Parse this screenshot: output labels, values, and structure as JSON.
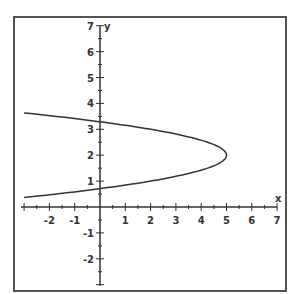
{
  "chart_data": {
    "type": "line",
    "title": "",
    "xlabel": "x",
    "ylabel": "y",
    "xlim": [
      -3,
      7
    ],
    "ylim": [
      -3,
      7
    ],
    "grid": false,
    "x_ticks": [
      -2,
      -1,
      1,
      2,
      3,
      4,
      5,
      6,
      7
    ],
    "y_ticks": [
      -2,
      -1,
      1,
      2,
      3,
      4,
      5,
      6,
      7
    ],
    "minor_tick_step": 0.5,
    "series": [
      {
        "name": "x = 5 - 3(y - 2)^2",
        "equation": "x = 5 - 3(y-2)^2",
        "vertex": [
          5,
          2
        ],
        "points": [
          [
            -3,
            3.63
          ],
          [
            -2,
            3.53
          ],
          [
            -1,
            3.41
          ],
          [
            0,
            3.29
          ],
          [
            1,
            3.15
          ],
          [
            2,
            3.0
          ],
          [
            3,
            2.82
          ],
          [
            4,
            2.58
          ],
          [
            4.5,
            2.41
          ],
          [
            5,
            2.0
          ],
          [
            4.5,
            1.59
          ],
          [
            4,
            1.42
          ],
          [
            3,
            1.18
          ],
          [
            2,
            1.0
          ],
          [
            1,
            0.85
          ],
          [
            0,
            0.71
          ],
          [
            -1,
            0.59
          ],
          [
            -2,
            0.47
          ],
          [
            -3,
            0.37
          ]
        ]
      }
    ]
  }
}
